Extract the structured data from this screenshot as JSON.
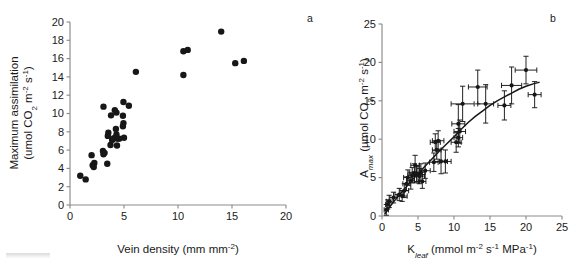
{
  "figure": {
    "background_color": "#ffffff",
    "point_color": "#171717",
    "axis_color": "#8c8c8c",
    "width": 581,
    "height": 263
  },
  "panels": {
    "a": {
      "label": "a",
      "label_x": 310,
      "label_y": 22
    },
    "b": {
      "label": "b",
      "label_x": 553,
      "label_y": 22
    }
  },
  "chart_data": [
    {
      "type": "scatter",
      "panel": "a",
      "title": "",
      "xlabel": "Vein density (mm mm-2)",
      "xlabel_parts": {
        "base": "Vein density (mm mm",
        "sup": "-2",
        "tail": ")"
      },
      "ylabel": "Maximum assimilation (umol CO2 m-2 s-1)",
      "ylabel_line1": "Maximum assimilation",
      "ylabel_line2_parts": {
        "a": "(umol CO",
        "sub1": "2",
        "b": " m",
        "sup1": "-2",
        "c": " s",
        "sup2": "-1",
        "d": ")"
      },
      "xlim": [
        0,
        20
      ],
      "ylim": [
        0,
        20
      ],
      "xticks": [
        0,
        5,
        10,
        15,
        20
      ],
      "yticks": [
        0,
        2,
        4,
        6,
        8,
        10,
        12,
        14,
        16,
        18,
        20
      ],
      "xticklabels": [
        "0",
        "5",
        "10",
        "15",
        "20"
      ],
      "yticklabels": [
        "0",
        "2",
        "4",
        "6",
        "8",
        "10",
        "12",
        "14",
        "16",
        "18",
        "20"
      ],
      "grid": false,
      "legend": "none",
      "marker": "filled-circle",
      "marker_size_px": 4.6,
      "points": [
        {
          "x": 0.95,
          "y": 3.2
        },
        {
          "x": 1.45,
          "y": 2.8
        },
        {
          "x": 2.0,
          "y": 5.45
        },
        {
          "x": 2.1,
          "y": 4.35
        },
        {
          "x": 2.25,
          "y": 4.6
        },
        {
          "x": 2.2,
          "y": 4.15
        },
        {
          "x": 3.1,
          "y": 10.75
        },
        {
          "x": 3.05,
          "y": 5.9
        },
        {
          "x": 3.2,
          "y": 5.7
        },
        {
          "x": 3.1,
          "y": 5.55
        },
        {
          "x": 3.45,
          "y": 4.5
        },
        {
          "x": 3.55,
          "y": 7.9
        },
        {
          "x": 3.5,
          "y": 7.55
        },
        {
          "x": 3.8,
          "y": 9.8
        },
        {
          "x": 3.75,
          "y": 6.55
        },
        {
          "x": 3.9,
          "y": 7.1
        },
        {
          "x": 4.05,
          "y": 7.3
        },
        {
          "x": 4.15,
          "y": 10.35
        },
        {
          "x": 4.3,
          "y": 10.1
        },
        {
          "x": 4.25,
          "y": 8.3
        },
        {
          "x": 4.3,
          "y": 7.7
        },
        {
          "x": 4.4,
          "y": 7.25
        },
        {
          "x": 4.35,
          "y": 6.5
        },
        {
          "x": 4.55,
          "y": 7.25
        },
        {
          "x": 4.95,
          "y": 11.25
        },
        {
          "x": 4.9,
          "y": 9.75
        },
        {
          "x": 4.95,
          "y": 8.95
        },
        {
          "x": 4.9,
          "y": 8.6
        },
        {
          "x": 5.0,
          "y": 7.35
        },
        {
          "x": 5.45,
          "y": 10.85
        },
        {
          "x": 6.1,
          "y": 14.55
        },
        {
          "x": 10.5,
          "y": 16.8
        },
        {
          "x": 10.9,
          "y": 16.95
        },
        {
          "x": 10.5,
          "y": 14.2
        },
        {
          "x": 14.0,
          "y": 18.95
        },
        {
          "x": 15.3,
          "y": 15.5
        },
        {
          "x": 16.1,
          "y": 15.75
        }
      ]
    },
    {
      "type": "scatter",
      "panel": "b",
      "title": "",
      "xlabel": "Kleaf (mmol m-2 s-1 MPa-1)",
      "xlabel_parts": {
        "base": "K",
        "sub": "leaf",
        "a": " (mmol m",
        "sup1": "-2",
        "b": " s",
        "sup2": "-1",
        "c": " MPa",
        "sup3": "-1",
        "d": ")"
      },
      "ylabel": "Amax (umol CO2 m-2 s-1)",
      "ylabel_parts": {
        "base": "A",
        "sub": "max",
        "a": " (µmol CO",
        "sub2": "2",
        "b": " m",
        "sup1": "-2",
        "c": " s",
        "sup2": "-1",
        "d": ")"
      },
      "xlim": [
        0,
        25
      ],
      "ylim": [
        0,
        25
      ],
      "xticks": [
        0,
        5,
        10,
        15,
        20,
        25
      ],
      "yticks": [
        0,
        5,
        10,
        15,
        20,
        25
      ],
      "xticklabels": [
        "0",
        "5",
        "10",
        "15",
        "20",
        "25"
      ],
      "yticklabels": [
        "0",
        "5",
        "10",
        "15",
        "20",
        "25"
      ],
      "grid": false,
      "legend": "none",
      "marker": "filled-circle",
      "marker_size_px": 3.2,
      "has_error_bars": true,
      "has_fit_curve": true,
      "fit_curve_description": "saturating increasing curve through point cloud",
      "fit_curve": [
        {
          "x": 0.4,
          "y": 0.3
        },
        {
          "x": 1.0,
          "y": 1.1
        },
        {
          "x": 2.0,
          "y": 2.3
        },
        {
          "x": 3.0,
          "y": 3.4
        },
        {
          "x": 4.0,
          "y": 4.5
        },
        {
          "x": 5.0,
          "y": 5.5
        },
        {
          "x": 6.0,
          "y": 6.5
        },
        {
          "x": 7.0,
          "y": 7.5
        },
        {
          "x": 8.0,
          "y": 8.5
        },
        {
          "x": 9.0,
          "y": 9.4
        },
        {
          "x": 10.0,
          "y": 10.3
        },
        {
          "x": 11.0,
          "y": 11.3
        },
        {
          "x": 12.0,
          "y": 12.2
        },
        {
          "x": 13.0,
          "y": 13.0
        },
        {
          "x": 14.0,
          "y": 13.7
        },
        {
          "x": 15.0,
          "y": 14.4
        },
        {
          "x": 16.0,
          "y": 15.0
        },
        {
          "x": 17.0,
          "y": 15.5
        },
        {
          "x": 18.0,
          "y": 16.0
        },
        {
          "x": 19.0,
          "y": 16.5
        },
        {
          "x": 20.0,
          "y": 16.9
        },
        {
          "x": 21.0,
          "y": 17.2
        },
        {
          "x": 21.8,
          "y": 17.4
        }
      ],
      "points": [
        {
          "x": 0.6,
          "y": 0.8,
          "xerr": 0.3,
          "yerr": 0.7
        },
        {
          "x": 0.8,
          "y": 1.5,
          "xerr": 0.3,
          "yerr": 0.6
        },
        {
          "x": 1.0,
          "y": 1.9,
          "xerr": 0.4,
          "yerr": 0.8
        },
        {
          "x": 1.6,
          "y": 2.4,
          "xerr": 0.5,
          "yerr": 0.7
        },
        {
          "x": 2.4,
          "y": 2.8,
          "xerr": 0.6,
          "yerr": 0.8
        },
        {
          "x": 2.8,
          "y": 2.6,
          "xerr": 0.7,
          "yerr": 0.7
        },
        {
          "x": 3.1,
          "y": 3.3,
          "xerr": 0.6,
          "yerr": 0.9
        },
        {
          "x": 3.4,
          "y": 4.2,
          "xerr": 0.5,
          "yerr": 0.9
        },
        {
          "x": 3.6,
          "y": 5.0,
          "xerr": 0.6,
          "yerr": 1.0
        },
        {
          "x": 4.0,
          "y": 4.6,
          "xerr": 0.5,
          "yerr": 1.1
        },
        {
          "x": 4.2,
          "y": 5.3,
          "xerr": 0.6,
          "yerr": 1.0
        },
        {
          "x": 4.5,
          "y": 5.6,
          "xerr": 0.7,
          "yerr": 1.2
        },
        {
          "x": 4.6,
          "y": 6.6,
          "xerr": 0.6,
          "yerr": 1.3
        },
        {
          "x": 4.8,
          "y": 5.5,
          "xerr": 0.5,
          "yerr": 1.0
        },
        {
          "x": 5.0,
          "y": 5.4,
          "xerr": 0.6,
          "yerr": 1.1
        },
        {
          "x": 5.2,
          "y": 5.2,
          "xerr": 0.7,
          "yerr": 1.0
        },
        {
          "x": 5.4,
          "y": 5.7,
          "xerr": 0.6,
          "yerr": 1.1
        },
        {
          "x": 5.6,
          "y": 4.5,
          "xerr": 0.5,
          "yerr": 0.9
        },
        {
          "x": 6.0,
          "y": 5.9,
          "xerr": 0.7,
          "yerr": 1.0
        },
        {
          "x": 7.2,
          "y": 7.0,
          "xerr": 0.6,
          "yerr": 1.2
        },
        {
          "x": 7.4,
          "y": 9.6,
          "xerr": 0.7,
          "yerr": 1.1
        },
        {
          "x": 7.6,
          "y": 8.6,
          "xerr": 0.6,
          "yerr": 1.2
        },
        {
          "x": 7.8,
          "y": 9.8,
          "xerr": 0.8,
          "yerr": 1.3
        },
        {
          "x": 8.2,
          "y": 7.1,
          "xerr": 0.9,
          "yerr": 1.6
        },
        {
          "x": 8.8,
          "y": 7.1,
          "xerr": 0.8,
          "yerr": 1.5
        },
        {
          "x": 10.3,
          "y": 9.6,
          "xerr": 0.7,
          "yerr": 1.3
        },
        {
          "x": 10.6,
          "y": 10.2,
          "xerr": 0.6,
          "yerr": 1.2
        },
        {
          "x": 10.8,
          "y": 11.0,
          "xerr": 0.8,
          "yerr": 1.5
        },
        {
          "x": 10.6,
          "y": 12.0,
          "xerr": 0.9,
          "yerr": 2.5
        },
        {
          "x": 11.2,
          "y": 14.6,
          "xerr": 1.6,
          "yerr": 2.3
        },
        {
          "x": 13.3,
          "y": 16.8,
          "xerr": 1.3,
          "yerr": 2.2
        },
        {
          "x": 14.4,
          "y": 14.6,
          "xerr": 1.1,
          "yerr": 2.5
        },
        {
          "x": 17.0,
          "y": 14.4,
          "xerr": 0.9,
          "yerr": 1.9
        },
        {
          "x": 18.0,
          "y": 17.0,
          "xerr": 1.4,
          "yerr": 2.4
        },
        {
          "x": 20.0,
          "y": 19.0,
          "xerr": 1.5,
          "yerr": 1.8
        },
        {
          "x": 21.2,
          "y": 15.8,
          "xerr": 0.9,
          "yerr": 1.7
        }
      ]
    }
  ]
}
